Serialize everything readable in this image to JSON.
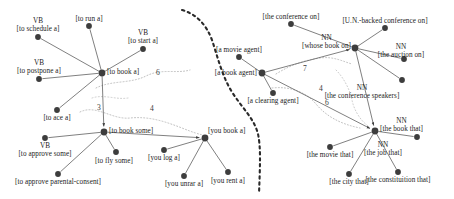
{
  "figure": {
    "title": "",
    "canvas": {
      "width": 454,
      "height": 199
    },
    "colors": {
      "node": "#3d3d3d",
      "edge": "#555555",
      "cluster_boundary": "#b9b9b9",
      "divider": "#2a2a2a",
      "text": "#1b1b1b"
    }
  },
  "chart_data": {
    "type": "scatter",
    "title": "",
    "xlabel": "",
    "ylabel": "",
    "grid": false,
    "legend": null,
    "nodes": [
      {
        "id": "to_schedule_a",
        "label": "[to schedule a]",
        "pos_tag": "VB",
        "x": 38,
        "y": 37,
        "hub": false,
        "panel": "left"
      },
      {
        "id": "to_run_a",
        "label": "[to run a]",
        "pos_tag": "",
        "x": 89,
        "y": 26,
        "hub": false,
        "panel": "left"
      },
      {
        "id": "to_start_a",
        "label": "[to start a]",
        "pos_tag": "VB",
        "x": 143,
        "y": 49,
        "hub": false,
        "panel": "left"
      },
      {
        "id": "to_postpone_a",
        "label": "[to postpone a]",
        "pos_tag": "VB",
        "x": 39,
        "y": 79,
        "hub": false,
        "panel": "left"
      },
      {
        "id": "to_book_a",
        "label": "[to book a]",
        "pos_tag": "",
        "x": 102,
        "y": 73,
        "hub": true,
        "panel": "left"
      },
      {
        "id": "to_ace_a",
        "label": "[to ace a]",
        "pos_tag": "",
        "x": 57,
        "y": 110,
        "hub": false,
        "panel": "left"
      },
      {
        "id": "to_book_some",
        "label": "[to book some]",
        "pos_tag": "",
        "x": 104,
        "y": 132,
        "hub": true,
        "panel": "left"
      },
      {
        "id": "to_approve_some",
        "label": "[to approve some]",
        "pos_tag": "VB",
        "x": 45,
        "y": 138,
        "hub": false,
        "panel": "left"
      },
      {
        "id": "to_fly_some",
        "label": "[to fly some]",
        "pos_tag": "",
        "x": 116,
        "y": 152,
        "hub": false,
        "panel": "left"
      },
      {
        "id": "to_approve_pc",
        "label": "[to approve parental-consent]",
        "pos_tag": "",
        "x": 58,
        "y": 174,
        "hub": false,
        "panel": "left"
      },
      {
        "id": "you_book_a",
        "label": "[you book a]",
        "pos_tag": "",
        "x": 205,
        "y": 138,
        "hub": true,
        "panel": "left"
      },
      {
        "id": "you_log_a",
        "label": "[you log a]",
        "pos_tag": "",
        "x": 164,
        "y": 150,
        "hub": false,
        "panel": "left"
      },
      {
        "id": "you_unrar_a",
        "label": "[you unrar a]",
        "pos_tag": "",
        "x": 184,
        "y": 176,
        "hub": false,
        "panel": "left"
      },
      {
        "id": "you_rent_a",
        "label": "[you rent a]",
        "pos_tag": "",
        "x": 228,
        "y": 172,
        "hub": false,
        "panel": "left"
      },
      {
        "id": "the_conf_on",
        "label": "[the conference on]",
        "pos_tag": "",
        "x": 291,
        "y": 24,
        "hub": false,
        "panel": "right"
      },
      {
        "id": "un_conf_on",
        "label": "[U.N.-backed conference on]",
        "pos_tag": "",
        "x": 385,
        "y": 28,
        "hub": false,
        "panel": "right"
      },
      {
        "id": "whose_book_on",
        "label": "[whose book on]",
        "pos_tag": "NN",
        "x": 355,
        "y": 48,
        "hub": true,
        "panel": "right"
      },
      {
        "id": "the_auction_on",
        "label": "[the auction on]",
        "pos_tag": "NN",
        "x": 404,
        "y": 59,
        "hub": false,
        "panel": "right"
      },
      {
        "id": "the_conf_spk",
        "label": "[the conference speakers]",
        "pos_tag": "NN",
        "x": 402,
        "y": 80,
        "hub": false,
        "panel": "right"
      },
      {
        "id": "a_movie_agent",
        "label": "[a movie agent]",
        "pos_tag": "",
        "x": 239,
        "y": 57,
        "hub": false,
        "panel": "right"
      },
      {
        "id": "a_book_agent",
        "label": "[a book agent]",
        "pos_tag": "",
        "x": 262,
        "y": 73,
        "hub": true,
        "panel": "right"
      },
      {
        "id": "a_clearing_ag",
        "label": "[a clearing agent]",
        "pos_tag": "",
        "x": 273,
        "y": 93,
        "hub": false,
        "panel": "right"
      },
      {
        "id": "the_book_that",
        "label": "[the book that]",
        "pos_tag": "NN",
        "x": 375,
        "y": 131,
        "hub": true,
        "panel": "right"
      },
      {
        "id": "the_job_that",
        "label": "[the job that]",
        "pos_tag": "NN",
        "x": 417,
        "y": 137,
        "hub": false,
        "panel": "right"
      },
      {
        "id": "the_movie_that",
        "label": "[the movie that]",
        "pos_tag": "",
        "x": 330,
        "y": 147,
        "hub": false,
        "panel": "right"
      },
      {
        "id": "the_city_that",
        "label": "[the city that]",
        "pos_tag": "",
        "x": 349,
        "y": 174,
        "hub": false,
        "panel": "right"
      },
      {
        "id": "the_const_that",
        "label": "[the constituition that]",
        "pos_tag": "",
        "x": 398,
        "y": 172,
        "hub": false,
        "panel": "right"
      }
    ],
    "edges": [
      {
        "from": "to_schedule_a",
        "to": "to_book_a",
        "arrow": false
      },
      {
        "from": "to_run_a",
        "to": "to_book_a",
        "arrow": false
      },
      {
        "from": "to_start_a",
        "to": "to_book_a",
        "arrow": false
      },
      {
        "from": "to_postpone_a",
        "to": "to_book_a",
        "arrow": false
      },
      {
        "from": "to_ace_a",
        "to": "to_book_a",
        "arrow": false
      },
      {
        "from": "to_book_a",
        "to": "to_book_some",
        "arrow": true
      },
      {
        "from": "to_approve_some",
        "to": "to_book_some",
        "arrow": false
      },
      {
        "from": "to_fly_some",
        "to": "to_book_some",
        "arrow": false
      },
      {
        "from": "to_approve_pc",
        "to": "to_book_some",
        "arrow": false
      },
      {
        "from": "to_book_some",
        "to": "you_book_a",
        "arrow": true
      },
      {
        "from": "you_log_a",
        "to": "you_book_a",
        "arrow": false
      },
      {
        "from": "you_unrar_a",
        "to": "you_book_a",
        "arrow": false
      },
      {
        "from": "you_rent_a",
        "to": "you_book_a",
        "arrow": false
      },
      {
        "from": "the_conf_on",
        "to": "whose_book_on",
        "arrow": false
      },
      {
        "from": "un_conf_on",
        "to": "whose_book_on",
        "arrow": false
      },
      {
        "from": "the_auction_on",
        "to": "whose_book_on",
        "arrow": false
      },
      {
        "from": "the_conf_spk",
        "to": "whose_book_on",
        "arrow": false
      },
      {
        "from": "a_movie_agent",
        "to": "a_book_agent",
        "arrow": false
      },
      {
        "from": "a_clearing_ag",
        "to": "a_book_agent",
        "arrow": false
      },
      {
        "from": "a_book_agent",
        "to": "whose_book_on",
        "arrow": true
      },
      {
        "from": "a_book_agent",
        "to": "the_book_that",
        "arrow": true
      },
      {
        "from": "whose_book_on",
        "to": "the_book_that",
        "arrow": true
      },
      {
        "from": "the_movie_that",
        "to": "the_book_that",
        "arrow": false
      },
      {
        "from": "the_city_that",
        "to": "the_book_that",
        "arrow": false
      },
      {
        "from": "the_const_that",
        "to": "the_book_that",
        "arrow": false
      },
      {
        "from": "the_job_that",
        "to": "the_book_that",
        "arrow": false
      }
    ],
    "edge_numbers": [
      {
        "value": "6",
        "x": 158,
        "y": 72
      },
      {
        "value": "3",
        "x": 99,
        "y": 107
      },
      {
        "value": "4",
        "x": 152,
        "y": 108
      },
      {
        "value": "7",
        "x": 305,
        "y": 68
      },
      {
        "value": "4",
        "x": 321,
        "y": 88
      },
      {
        "value": "6",
        "x": 327,
        "y": 102
      }
    ]
  }
}
